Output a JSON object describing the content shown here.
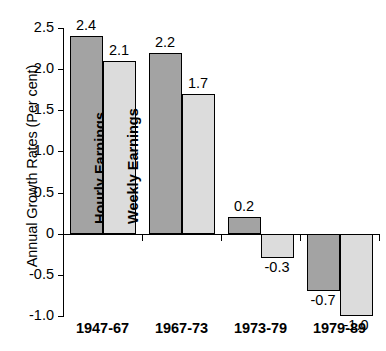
{
  "chart_data": {
    "type": "bar",
    "title": "",
    "xlabel": "",
    "ylabel": "Annual Growth Rates (Per cent)",
    "ylim": [
      -1.0,
      2.5
    ],
    "grid": false,
    "legend_position": "in-bar",
    "categories": [
      "1947-67",
      "1967-73",
      "1973-79",
      "1979-89"
    ],
    "series": [
      {
        "name": "Hourly Earnings",
        "color": "#a3a3a3",
        "values": [
          2.4,
          2.2,
          0.2,
          -0.7
        ],
        "value_labels": [
          "2.4",
          "2.2",
          "0.2",
          "-0.7"
        ]
      },
      {
        "name": "Weekly Earnings",
        "color": "#dcdcdc",
        "values": [
          2.1,
          1.7,
          -0.3,
          -1.0
        ],
        "value_labels": [
          "2.1",
          "1.7",
          "-0.3",
          "-1.0"
        ]
      }
    ],
    "y_ticks": [
      2.5,
      2.0,
      1.5,
      1.0,
      0.5,
      0.0,
      -0.5,
      -1.0
    ],
    "y_tick_labels": [
      "2.5",
      "2.0",
      "1.5",
      "1.0",
      "0.5",
      "0",
      "-0.5",
      "-1.0"
    ]
  },
  "axis": {
    "y_title": "Annual Growth Rates (Per cent)",
    "ticks": [
      {
        "label": "2.5",
        "value": 2.5
      },
      {
        "label": "2.0",
        "value": 2.0
      },
      {
        "label": "1.5",
        "value": 1.5
      },
      {
        "label": "1.0",
        "value": 1.0
      },
      {
        "label": "0.5",
        "value": 0.5
      },
      {
        "label": "0",
        "value": 0.0
      },
      {
        "label": "-0.5",
        "value": -0.5
      },
      {
        "label": "-1.0",
        "value": -1.0
      }
    ]
  },
  "categories": [
    {
      "label": "1947-67"
    },
    {
      "label": "1967-73"
    },
    {
      "label": "1973-79"
    },
    {
      "label": "1979-89"
    }
  ],
  "bars": [
    {
      "series": "Hourly Earnings",
      "category": "1947-67",
      "value": 2.4,
      "value_label": "2.4",
      "inner_label": "Hourly Earnings",
      "tone": "dark"
    },
    {
      "series": "Weekly Earnings",
      "category": "1947-67",
      "value": 2.1,
      "value_label": "2.1",
      "inner_label": "Weekly Earnings",
      "tone": "light"
    },
    {
      "series": "Hourly Earnings",
      "category": "1967-73",
      "value": 2.2,
      "value_label": "2.2",
      "inner_label": "",
      "tone": "dark"
    },
    {
      "series": "Weekly Earnings",
      "category": "1967-73",
      "value": 1.7,
      "value_label": "1.7",
      "inner_label": "",
      "tone": "light"
    },
    {
      "series": "Hourly Earnings",
      "category": "1973-79",
      "value": 0.2,
      "value_label": "0.2",
      "inner_label": "",
      "tone": "dark"
    },
    {
      "series": "Weekly Earnings",
      "category": "1973-79",
      "value": -0.3,
      "value_label": "-0.3",
      "inner_label": "",
      "tone": "light"
    },
    {
      "series": "Hourly Earnings",
      "category": "1979-89",
      "value": -0.7,
      "value_label": "-0.7",
      "inner_label": "",
      "tone": "dark"
    },
    {
      "series": "Weekly Earnings",
      "category": "1979-89",
      "value": -1.0,
      "value_label": "-1.0",
      "inner_label": "",
      "tone": "light"
    }
  ],
  "colors": {
    "hourly_earnings": "#a3a3a3",
    "weekly_earnings": "#dcdcdc",
    "axis": "#000000",
    "background": "#ffffff"
  }
}
